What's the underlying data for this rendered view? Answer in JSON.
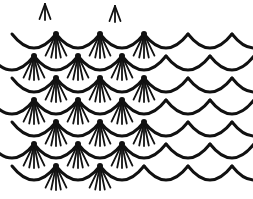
{
  "image": {
    "description": "Hand-drawn black line illustration of overlapping fish scales",
    "background": "#ffffff",
    "stroke_color": "#111111"
  },
  "pattern": {
    "scale_width": 44,
    "row_spacing": 22,
    "rows": [
      {
        "y": 48,
        "offset": 12,
        "count": 6,
        "fans_until": 3
      },
      {
        "y": 70,
        "offset": -10,
        "count": 7,
        "fans_until": 3
      },
      {
        "y": 92,
        "offset": 12,
        "count": 6,
        "fans_until": 3
      },
      {
        "y": 114,
        "offset": -10,
        "count": 7,
        "fans_until": 3
      },
      {
        "y": 136,
        "offset": 12,
        "count": 6,
        "fans_until": 3
      },
      {
        "y": 158,
        "offset": -10,
        "count": 7,
        "fans_until": 3
      },
      {
        "y": 180,
        "offset": 12,
        "count": 6,
        "fans_until": 2
      }
    ],
    "top_tufts": [
      {
        "x": 45,
        "y": 4
      },
      {
        "x": 115,
        "y": 6
      }
    ]
  }
}
